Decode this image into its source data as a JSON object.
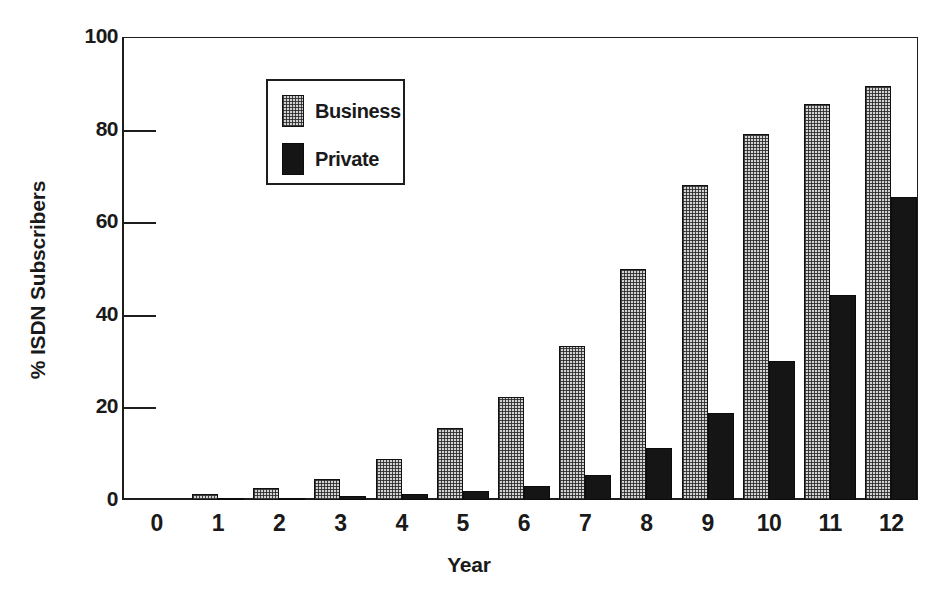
{
  "chart_data": {
    "type": "bar",
    "title": "",
    "xlabel": "Year",
    "ylabel": "% ISDN Subscribers",
    "categories": [
      "0",
      "1",
      "2",
      "3",
      "4",
      "5",
      "6",
      "7",
      "8",
      "9",
      "10",
      "11",
      "12"
    ],
    "series": [
      {
        "name": "Business",
        "color": "#d2d2d2",
        "pattern": "stipple-checker",
        "values": [
          0,
          1.3,
          2.6,
          4.5,
          8.8,
          15.5,
          22.3,
          33.3,
          50.0,
          68.0,
          79.0,
          85.5,
          89.5
        ]
      },
      {
        "name": "Private",
        "color": "#151515",
        "pattern": "solid",
        "values": [
          0,
          0.2,
          0.4,
          0.8,
          1.3,
          2.0,
          3.0,
          5.5,
          11.3,
          18.8,
          30.0,
          44.3,
          65.5
        ]
      }
    ],
    "ylim": [
      0,
      100
    ],
    "yticks": [
      0,
      20,
      40,
      60,
      80,
      100
    ],
    "ytick_labels": [
      "0",
      "20",
      "40",
      "60",
      "80",
      "100"
    ],
    "xtick_labels": [
      "0",
      "1",
      "2",
      "3",
      "4",
      "5",
      "6",
      "7",
      "8",
      "9",
      "10",
      "11",
      "12"
    ],
    "grid": false,
    "legend_position": "upper-left-inside",
    "legend_entries": [
      "Business",
      "Private"
    ]
  }
}
